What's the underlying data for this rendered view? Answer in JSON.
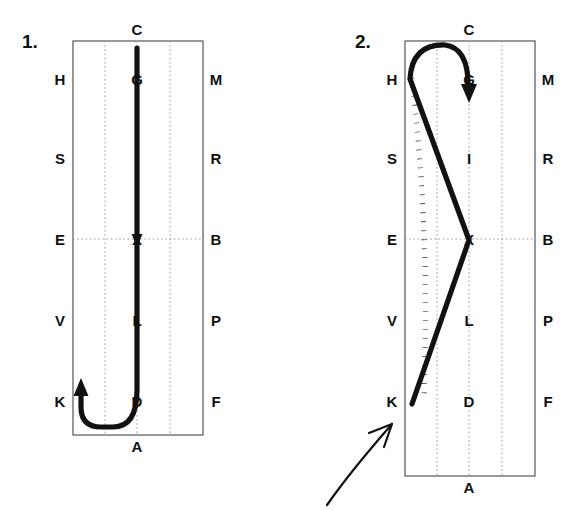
{
  "figure": {
    "width": 585,
    "height": 510,
    "background": "#ffffff",
    "ink_color": "#111111",
    "box_color": "#555555",
    "grid_color": "#9a9a9a"
  },
  "panels": [
    {
      "number": "1.",
      "number_pos": {
        "x": 22,
        "y": 48
      },
      "box": {
        "x": 73,
        "y": 41,
        "width": 130,
        "height": 394
      },
      "grid": {
        "vertical_x": [
          105,
          137,
          170
        ],
        "horizontal_y": [
          239
        ]
      },
      "labels": {
        "top": {
          "text": "C",
          "x": 137,
          "y": 35
        },
        "bottom": {
          "text": "A",
          "x": 137,
          "y": 452
        },
        "left": [
          {
            "text": "H",
            "x": 60,
            "y": 85
          },
          {
            "text": "S",
            "x": 60,
            "y": 164
          },
          {
            "text": "E",
            "x": 60,
            "y": 245
          },
          {
            "text": "V",
            "x": 60,
            "y": 326
          },
          {
            "text": "K",
            "x": 60,
            "y": 407
          }
        ],
        "right": [
          {
            "text": "M",
            "x": 216,
            "y": 85
          },
          {
            "text": "R",
            "x": 216,
            "y": 164
          },
          {
            "text": "B",
            "x": 216,
            "y": 245
          },
          {
            "text": "P",
            "x": 216,
            "y": 326
          },
          {
            "text": "F",
            "x": 216,
            "y": 407
          }
        ],
        "inner": [
          {
            "text": "G",
            "x": 137,
            "y": 85
          },
          {
            "text": "I",
            "x": 137,
            "y": 164
          },
          {
            "text": "X",
            "x": 137,
            "y": 245
          },
          {
            "text": "L",
            "x": 137,
            "y": 326
          },
          {
            "text": "D",
            "x": 137,
            "y": 407
          }
        ]
      },
      "trace": {
        "description": "straight-down-then-hook-left",
        "path": "M 137 48 L 137 390 Q 137 427 113 427 L 101 427 Q 81 427 81 407 L 81 392",
        "arrow": {
          "tip_x": 81,
          "tip_y": 381,
          "direction": "up"
        },
        "mid_marker": {
          "x": 137,
          "y": 240,
          "direction": "down"
        }
      },
      "dotted_trace": null,
      "callout": null
    },
    {
      "number": "2.",
      "number_pos": {
        "x": 355,
        "y": 48
      },
      "box": {
        "x": 405,
        "y": 41,
        "width": 130,
        "height": 435
      },
      "grid": {
        "vertical_x": [
          437,
          469,
          502
        ],
        "horizontal_y": [
          239
        ]
      },
      "labels": {
        "top": {
          "text": "C",
          "x": 469,
          "y": 35
        },
        "bottom": {
          "text": "A",
          "x": 469,
          "y": 452
        },
        "left": [
          {
            "text": "H",
            "x": 392,
            "y": 85
          },
          {
            "text": "S",
            "x": 392,
            "y": 164
          },
          {
            "text": "E",
            "x": 392,
            "y": 245
          },
          {
            "text": "V",
            "x": 392,
            "y": 326
          },
          {
            "text": "K",
            "x": 392,
            "y": 407
          }
        ],
        "right": [
          {
            "text": "M",
            "x": 548,
            "y": 85
          },
          {
            "text": "R",
            "x": 548,
            "y": 164
          },
          {
            "text": "B",
            "x": 548,
            "y": 245
          },
          {
            "text": "P",
            "x": 548,
            "y": 326
          },
          {
            "text": "F",
            "x": 548,
            "y": 407
          }
        ],
        "inner": [
          {
            "text": "G",
            "x": 469,
            "y": 85
          },
          {
            "text": "I",
            "x": 469,
            "y": 164
          },
          {
            "text": "X",
            "x": 469,
            "y": 245
          },
          {
            "text": "L",
            "x": 469,
            "y": 326
          },
          {
            "text": "D",
            "x": 469,
            "y": 407
          }
        ]
      },
      "trace": {
        "description": "loop-over-top-then-zigzag-to-K",
        "path": "M 469 92 Q 469 46 443 45 Q 411 45 410 78 L 469 240 L 411 404",
        "arrow": {
          "tip_x": 469,
          "tip_y": 100,
          "direction": "down"
        }
      },
      "dotted_trace": {
        "description": "dotted-reference-curve-H-to-K",
        "path": "M 412 78 Q 428 240 424 398"
      },
      "callout": {
        "description": "hand-drawn-curved-arrow-pointing-up-right",
        "path": "M 327 504 Q 352 470 393 424",
        "head": "M 393 424 L 373 432 M 393 424 L 385 444"
      }
    }
  ]
}
